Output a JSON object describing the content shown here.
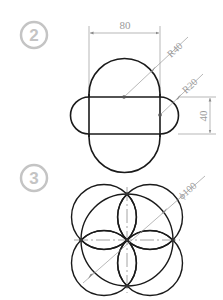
{
  "figures": [
    {
      "step": "2",
      "dimensions": {
        "width": "80",
        "large_radius": "R40",
        "small_radius": "R20",
        "height": "40"
      }
    },
    {
      "step": "3",
      "dimensions": {
        "diameter": "ϕ100"
      }
    }
  ],
  "colors": {
    "outline": "#1a1a1a",
    "dimension": "#9a9a9a",
    "step_badge": "#c4c4c4"
  }
}
